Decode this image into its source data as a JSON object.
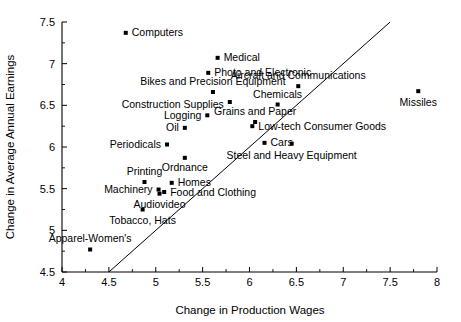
{
  "chart_data": {
    "type": "scatter",
    "title": "",
    "xlabel": "Change in Production Wages",
    "ylabel": "Change in Average Annual Earnings",
    "xlim": [
      4,
      8
    ],
    "ylim": [
      4.5,
      7.5
    ],
    "xticks": [
      "4",
      "4.5",
      "5",
      "5.5",
      "6",
      "6.5",
      "7",
      "7.5",
      "8"
    ],
    "xtick_values": [
      4,
      4.5,
      5,
      5.5,
      6,
      6.5,
      7,
      7.5,
      8
    ],
    "yticks": [
      "4.5",
      "5",
      "5.5",
      "6",
      "6.5",
      "7",
      "7.5"
    ],
    "ytick_values": [
      4.5,
      5,
      5.5,
      6,
      6.5,
      7,
      7.5
    ],
    "grid": false,
    "legend": "none",
    "reference_line": {
      "type": "45-degree-line",
      "from": [
        4.5,
        4.5
      ],
      "to": [
        7.5,
        7.5
      ]
    },
    "points": [
      {
        "label": "Computers",
        "x": 4.68,
        "y": 7.37,
        "anchor": "start",
        "dx": 6,
        "dy": 3.5
      },
      {
        "label": "Medical",
        "x": 5.66,
        "y": 7.07,
        "anchor": "start",
        "dx": 6,
        "dy": 3.5
      },
      {
        "label": "Photo and Electronic",
        "x": 5.56,
        "y": 6.89,
        "anchor": "start",
        "dx": 6,
        "dy": 3.5
      },
      {
        "label": "Bikes and Precision Equipment",
        "x": 5.61,
        "y": 6.66,
        "anchor": "mid",
        "dx": 0,
        "dy": -7
      },
      {
        "label": "Aircraft and Communications",
        "x": 6.52,
        "y": 6.73,
        "anchor": "mid",
        "dx": 0,
        "dy": -7
      },
      {
        "label": "Missiles",
        "x": 7.8,
        "y": 6.67,
        "anchor": "mid",
        "dx": 0,
        "dy": 15
      },
      {
        "label": "Construction Supplies",
        "x": 5.79,
        "y": 6.54,
        "anchor": "end",
        "dx": -6,
        "dy": 6
      },
      {
        "label": "Chemicals",
        "x": 6.3,
        "y": 6.51,
        "anchor": "mid",
        "dx": 0,
        "dy": -7
      },
      {
        "label": "Logging",
        "x": 5.55,
        "y": 6.38,
        "anchor": "end",
        "dx": -6,
        "dy": 3.5
      },
      {
        "label": "Grains and Paper",
        "x": 6.06,
        "y": 6.3,
        "anchor": "mid",
        "dx": 0,
        "dy": -7
      },
      {
        "label": "Low-tech Consumer Goods",
        "x": 6.03,
        "y": 6.25,
        "anchor": "start",
        "dx": 6,
        "dy": 3.5
      },
      {
        "label": "Oil",
        "x": 5.31,
        "y": 6.23,
        "anchor": "end",
        "dx": -6,
        "dy": 3.5
      },
      {
        "label": "Cars",
        "x": 6.16,
        "y": 6.05,
        "anchor": "start",
        "dx": 6,
        "dy": 3.5
      },
      {
        "label": "Periodicals",
        "x": 5.12,
        "y": 6.03,
        "anchor": "end",
        "dx": -6,
        "dy": 3.5
      },
      {
        "label": "Steel and Heavy Equipment",
        "x": 6.45,
        "y": 6.04,
        "anchor": "mid",
        "dx": 0,
        "dy": 15
      },
      {
        "label": "Ordnance",
        "x": 5.31,
        "y": 5.87,
        "anchor": "mid",
        "dx": 0,
        "dy": 13
      },
      {
        "label": "Homes",
        "x": 5.17,
        "y": 5.57,
        "anchor": "start",
        "dx": 6,
        "dy": 3.5
      },
      {
        "label": "Printing",
        "x": 4.88,
        "y": 5.58,
        "anchor": "mid",
        "dx": 0,
        "dy": -7
      },
      {
        "label": "Machinery",
        "x": 5.03,
        "y": 5.49,
        "anchor": "end",
        "dx": -6,
        "dy": 3.5
      },
      {
        "label": "Food and Clothing",
        "x": 5.09,
        "y": 5.46,
        "anchor": "start",
        "dx": 6,
        "dy": 3.5
      },
      {
        "label": "Audiovideo",
        "x": 5.04,
        "y": 5.44,
        "anchor": "mid",
        "dx": 0,
        "dy": 14
      },
      {
        "label": "Tobacco, Hats",
        "x": 4.86,
        "y": 5.25,
        "anchor": "mid",
        "dx": 0,
        "dy": 14
      },
      {
        "label": "Apparel-Women's",
        "x": 4.3,
        "y": 4.77,
        "anchor": "mid",
        "dx": 0,
        "dy": -8
      }
    ]
  }
}
